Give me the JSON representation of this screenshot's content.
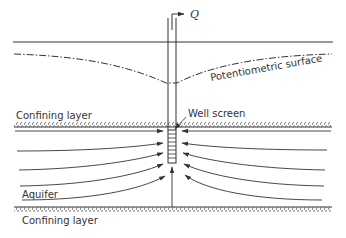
{
  "diagram": {
    "labels": {
      "discharge": "Q",
      "potentiometric_surface": "Potentiometric surface",
      "upper_confining_layer": "Confining layer",
      "well_screen": "Well screen",
      "aquifer": "Aquifer",
      "lower_confining_layer": "Confining layer"
    },
    "colors": {
      "ink": "#333333",
      "background": "#ffffff"
    },
    "flow_arrows": {
      "left_count": 5,
      "right_count": 5,
      "vertical_count": 1
    }
  }
}
